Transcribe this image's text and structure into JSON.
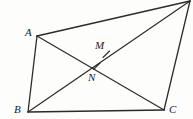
{
  "figure": {
    "kind": "geometry-diagram",
    "canvas": {
      "width": 193,
      "height": 119
    },
    "stroke_color": "#2b2b2b",
    "background_color": "#fdfdfc",
    "label_color": "#1b1b1b",
    "vertices": [
      {
        "id": "A",
        "label": "A",
        "x": 37,
        "y": 36,
        "label_x": 25,
        "label_y": 27
      },
      {
        "id": "B",
        "label": "B",
        "x": 28,
        "y": 112,
        "label_x": 14,
        "label_y": 104
      },
      {
        "id": "C",
        "label": "C",
        "x": 164,
        "y": 110,
        "label_x": 169,
        "label_y": 104
      },
      {
        "id": "D",
        "label": "",
        "x": 190,
        "y": 1,
        "label_x": 0,
        "label_y": 0
      }
    ],
    "points": [
      {
        "id": "M",
        "label": "M",
        "x": 106,
        "y": 54,
        "label_x": 95,
        "label_y": 40
      },
      {
        "id": "N",
        "label": "N",
        "x": 97,
        "y": 66,
        "label_x": 88,
        "label_y": 72
      }
    ],
    "edges": [
      {
        "id": "AB",
        "from": "A",
        "to": "B",
        "x1": 37,
        "y1": 36,
        "x2": 28,
        "y2": 112
      },
      {
        "id": "BC",
        "from": "B",
        "to": "C",
        "x1": 28,
        "y1": 112,
        "x2": 164,
        "y2": 110
      },
      {
        "id": "CD",
        "from": "C",
        "to": "D",
        "x1": 164,
        "y1": 110,
        "x2": 190,
        "y2": 1
      },
      {
        "id": "DA",
        "from": "D",
        "to": "A",
        "x1": 190,
        "y1": 1,
        "x2": 37,
        "y2": 36
      }
    ],
    "diagonals": [
      {
        "id": "AC",
        "from": "A",
        "to": "C",
        "x1": 37,
        "y1": 36,
        "x2": 164,
        "y2": 110
      },
      {
        "id": "BD",
        "from": "B",
        "to": "D",
        "x1": 28,
        "y1": 112,
        "x2": 190,
        "y2": 1
      }
    ],
    "tick_marks": [
      {
        "id": "tick-M",
        "on": "BD",
        "x": 106,
        "y": 54,
        "x1": 103,
        "y1": 57,
        "x2": 109,
        "y2": 51
      },
      {
        "id": "tick-N",
        "on": "BD",
        "x": 97,
        "y": 66,
        "x1": 94,
        "y1": 69,
        "x2": 100,
        "y2": 63
      }
    ],
    "intersection": {
      "id": "P",
      "x": 88,
      "y": 68
    }
  }
}
